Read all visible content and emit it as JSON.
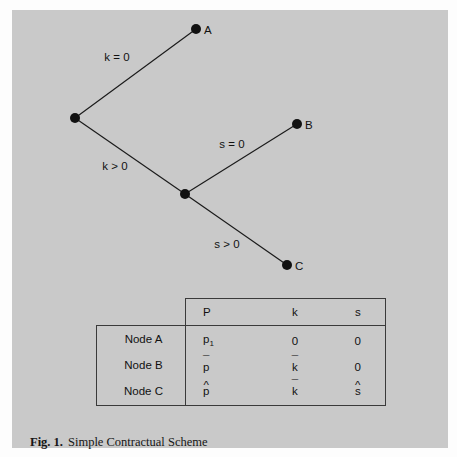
{
  "figure": {
    "background_color": "#c9c9c9",
    "page_color": "#fdfdfd",
    "ink_color": "#111111",
    "rule_color": "#3a3a3a"
  },
  "caption": {
    "label": "Fig. 1.",
    "text": "Simple Contractual Scheme"
  },
  "chart_data": {
    "type": "diagram",
    "diagram_kind": "decision-tree",
    "title": "Simple Contractual Scheme",
    "nodes": [
      {
        "id": "root",
        "label": "",
        "x": 75,
        "y": 118,
        "terminal": false
      },
      {
        "id": "A",
        "label": "A",
        "x": 196,
        "y": 29,
        "terminal": true
      },
      {
        "id": "middle",
        "label": "",
        "x": 185,
        "y": 194,
        "terminal": false
      },
      {
        "id": "B",
        "label": "B",
        "x": 297,
        "y": 124,
        "terminal": true
      },
      {
        "id": "C",
        "label": "C",
        "x": 287,
        "y": 265,
        "terminal": true
      }
    ],
    "edges": [
      {
        "from": "root",
        "to": "A",
        "label": "k = 0",
        "label_x": 117,
        "label_y": 61
      },
      {
        "from": "root",
        "to": "middle",
        "label": "k > 0",
        "label_x": 115,
        "label_y": 170
      },
      {
        "from": "middle",
        "to": "B",
        "label": "s = 0",
        "label_x": 232,
        "label_y": 148
      },
      {
        "from": "middle",
        "to": "C",
        "label": "s > 0",
        "label_x": 227,
        "label_y": 248
      }
    ],
    "node_radius": 5.0
  },
  "table": {
    "row_header_labels": [
      "Node A",
      "Node B",
      "Node C"
    ],
    "columns": [
      "P",
      "k",
      "s"
    ],
    "rows": [
      {
        "node": "Node A",
        "P": {
          "base": "p",
          "sub": "1",
          "mark": ""
        },
        "k": {
          "base": "0",
          "sub": "",
          "mark": ""
        },
        "s": {
          "base": "0",
          "sub": "",
          "mark": ""
        }
      },
      {
        "node": "Node B",
        "P": {
          "base": "p",
          "sub": "",
          "mark": "¯"
        },
        "k": {
          "base": "k",
          "sub": "",
          "mark": "¯"
        },
        "s": {
          "base": "0",
          "sub": "",
          "mark": ""
        }
      },
      {
        "node": "Node C",
        "P": {
          "base": "p",
          "sub": "",
          "mark": "^"
        },
        "k": {
          "base": "k",
          "sub": "",
          "mark": "¯"
        },
        "s": {
          "base": "s",
          "sub": "",
          "mark": "^"
        }
      }
    ]
  }
}
